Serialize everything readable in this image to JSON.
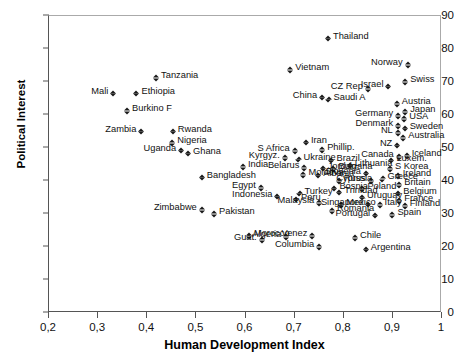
{
  "chart_data": {
    "type": "scatter",
    "title": "",
    "xlabel": "Human Development Index",
    "ylabel": "Political Interest",
    "xlim": [
      0.2,
      1.0
    ],
    "ylim": [
      0,
      90
    ],
    "xticks": [
      "0,2",
      "0,3",
      "0,4",
      "0,5",
      "0,6",
      "0,7",
      "0,8",
      "0,9",
      "1"
    ],
    "xtick_values": [
      0.2,
      0.3,
      0.4,
      0.5,
      0.6,
      0.7,
      0.8,
      0.9,
      1.0
    ],
    "yticks": [
      "0",
      "10",
      "20",
      "30",
      "40",
      "50",
      "60",
      "70",
      "80",
      "90"
    ],
    "ytick_values": [
      0,
      10,
      20,
      30,
      40,
      50,
      60,
      70,
      80,
      90
    ],
    "grid": false,
    "legend": false,
    "marker": "filled-diamond",
    "marker_color": "#1a1a1a",
    "points": [
      {
        "label": "Tanzania",
        "x": 0.418,
        "y": 71.8,
        "side": "r"
      },
      {
        "label": "Mali",
        "x": 0.331,
        "y": 67.0,
        "side": "l"
      },
      {
        "label": "Ethiopia",
        "x": 0.378,
        "y": 67.0,
        "side": "r"
      },
      {
        "label": "Burkino F",
        "x": 0.359,
        "y": 61.7,
        "side": "r"
      },
      {
        "label": "Zambia",
        "x": 0.388,
        "y": 55.6,
        "side": "l"
      },
      {
        "label": "Rwanda",
        "x": 0.452,
        "y": 55.6,
        "side": "r"
      },
      {
        "label": "Nigeria",
        "x": 0.451,
        "y": 52.1,
        "side": "r"
      },
      {
        "label": "Uganda",
        "x": 0.469,
        "y": 49.8,
        "side": "l"
      },
      {
        "label": "Ghana",
        "x": 0.483,
        "y": 48.9,
        "side": "r"
      },
      {
        "label": "Bangladesh",
        "x": 0.511,
        "y": 41.6,
        "side": "r"
      },
      {
        "label": "Zimbabwe",
        "x": 0.511,
        "y": 31.7,
        "side": "l"
      },
      {
        "label": "Pakistan",
        "x": 0.536,
        "y": 30.5,
        "side": "r"
      },
      {
        "label": "India",
        "x": 0.595,
        "y": 44.8,
        "side": "r"
      },
      {
        "label": "Egypt",
        "x": 0.631,
        "y": 38.5,
        "side": "l"
      },
      {
        "label": "Indonesia",
        "x": 0.665,
        "y": 35.8,
        "side": "l"
      },
      {
        "label": "Morocco",
        "x": 0.607,
        "y": 23.8,
        "side": "r"
      },
      {
        "label": "Guat.",
        "x": 0.633,
        "y": 22.6,
        "side": "l"
      },
      {
        "label": "Algeria",
        "x": 0.683,
        "y": 23.6,
        "side": "l"
      },
      {
        "label": "Venez",
        "x": 0.736,
        "y": 23.9,
        "side": "l"
      },
      {
        "label": "Columbia",
        "x": 0.75,
        "y": 20.5,
        "side": "l"
      },
      {
        "label": "Chile",
        "x": 0.823,
        "y": 23.2,
        "side": "r"
      },
      {
        "label": "Argentina",
        "x": 0.845,
        "y": 19.8,
        "side": "r"
      },
      {
        "label": "Kyrgyz.",
        "x": 0.68,
        "y": 47.6,
        "side": "l"
      },
      {
        "label": "S Africa",
        "x": 0.7,
        "y": 49.6,
        "side": "l"
      },
      {
        "label": "Iran",
        "x": 0.723,
        "y": 52.2,
        "side": "r"
      },
      {
        "label": "Ukraine",
        "x": 0.708,
        "y": 47.1,
        "side": "r"
      },
      {
        "label": "Belarus",
        "x": 0.72,
        "y": 44.5,
        "side": "l"
      },
      {
        "label": "Moldova",
        "x": 0.718,
        "y": 42.3,
        "side": "r"
      },
      {
        "label": "Albania",
        "x": 0.748,
        "y": 42.2,
        "side": "r"
      },
      {
        "label": "Turkey",
        "x": 0.71,
        "y": 36.8,
        "side": "r"
      },
      {
        "label": "Peru",
        "x": 0.703,
        "y": 34.9,
        "side": "r"
      },
      {
        "label": "Malaysia",
        "x": 0.75,
        "y": 33.9,
        "side": "l"
      },
      {
        "label": "Phillip.",
        "x": 0.756,
        "y": 50.0,
        "side": "r"
      },
      {
        "label": "Brazil",
        "x": 0.775,
        "y": 46.8,
        "side": "r"
      },
      {
        "label": "Jordan",
        "x": 0.757,
        "y": 44.3,
        "side": "r"
      },
      {
        "label": "Bulgaria",
        "x": 0.779,
        "y": 44.2,
        "side": "r"
      },
      {
        "label": "Russia",
        "x": 0.79,
        "y": 40.6,
        "side": "r"
      },
      {
        "label": "Bosnia",
        "x": 0.781,
        "y": 38.3,
        "side": "r"
      },
      {
        "label": "Trinidad",
        "x": 0.791,
        "y": 37.1,
        "side": "r"
      },
      {
        "label": "Mexico",
        "x": 0.795,
        "y": 33.3,
        "side": "r"
      },
      {
        "label": "Romania",
        "x": 0.776,
        "y": 31.4,
        "side": "r"
      },
      {
        "label": "Lithuania",
        "x": 0.812,
        "y": 45.2,
        "side": "r"
      },
      {
        "label": "Slovenia",
        "x": 0.845,
        "y": 42.8,
        "side": "l"
      },
      {
        "label": "Cyprus",
        "x": 0.855,
        "y": 40.6,
        "side": "l"
      },
      {
        "label": "Poland",
        "x": 0.838,
        "y": 38.1,
        "side": "r"
      },
      {
        "label": "Uruguay",
        "x": 0.837,
        "y": 35.5,
        "side": "r"
      },
      {
        "label": "Singapore",
        "x": 0.85,
        "y": 33.4,
        "side": "l"
      },
      {
        "label": "Italy",
        "x": 0.873,
        "y": 33.2,
        "side": "r"
      },
      {
        "label": "Portugal",
        "x": 0.864,
        "y": 30.1,
        "side": "l"
      },
      {
        "label": "Spain",
        "x": 0.899,
        "y": 30.3,
        "side": "r"
      },
      {
        "label": "Greece",
        "x": 0.879,
        "y": 41.2,
        "side": "r"
      },
      {
        "label": "Ireland",
        "x": 0.91,
        "y": 42.0,
        "side": "r"
      },
      {
        "label": "Britain",
        "x": 0.913,
        "y": 39.4,
        "side": "r"
      },
      {
        "label": "Belgium",
        "x": 0.911,
        "y": 36.8,
        "side": "r"
      },
      {
        "label": "France",
        "x": 0.913,
        "y": 34.5,
        "side": "r"
      },
      {
        "label": "Finland",
        "x": 0.924,
        "y": 32.9,
        "side": "r"
      },
      {
        "label": "S Korea",
        "x": 0.894,
        "y": 44.1,
        "side": "r"
      },
      {
        "label": "Luxem.",
        "x": 0.897,
        "y": 46.7,
        "side": "r"
      },
      {
        "label": "Iceland",
        "x": 0.928,
        "y": 48.2,
        "side": "r"
      },
      {
        "label": "Canada",
        "x": 0.912,
        "y": 47.9,
        "side": "l"
      },
      {
        "label": "NZ",
        "x": 0.909,
        "y": 51.3,
        "side": "l"
      },
      {
        "label": "Australia",
        "x": 0.921,
        "y": 53.6,
        "side": "r"
      },
      {
        "label": "NL",
        "x": 0.91,
        "y": 55.1,
        "side": "l"
      },
      {
        "label": "Sweden",
        "x": 0.924,
        "y": 56.4,
        "side": "r"
      },
      {
        "label": "Denmark",
        "x": 0.911,
        "y": 57.2,
        "side": "l"
      },
      {
        "label": "USA",
        "x": 0.923,
        "y": 59.3,
        "side": "r"
      },
      {
        "label": "Germany",
        "x": 0.911,
        "y": 60.2,
        "side": "l"
      },
      {
        "label": "Japan",
        "x": 0.925,
        "y": 61.4,
        "side": "r"
      },
      {
        "label": "Austria",
        "x": 0.908,
        "y": 63.9,
        "side": "r"
      },
      {
        "label": "Swiss",
        "x": 0.925,
        "y": 70.6,
        "side": "r"
      },
      {
        "label": "Israel",
        "x": 0.891,
        "y": 69.2,
        "side": "l"
      },
      {
        "label": "Norway",
        "x": 0.93,
        "y": 75.7,
        "side": "l"
      },
      {
        "label": "CZ Rep",
        "x": 0.849,
        "y": 68.4,
        "side": "l"
      },
      {
        "label": "Saudi A",
        "x": 0.769,
        "y": 65.3,
        "side": "r"
      },
      {
        "label": "China",
        "x": 0.756,
        "y": 65.9,
        "side": "l"
      },
      {
        "label": "Thailand",
        "x": 0.768,
        "y": 83.7,
        "side": "r"
      },
      {
        "label": "Vietnam",
        "x": 0.691,
        "y": 74.1,
        "side": "r"
      }
    ]
  }
}
